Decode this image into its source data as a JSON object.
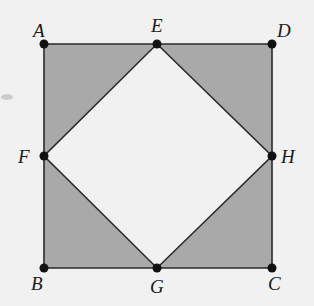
{
  "diagram": {
    "type": "geometry-figure",
    "colors": {
      "background": "#f1f1f1",
      "shaded_fill": "#a9a9a9",
      "line": "#2a2a2a",
      "point": "#111111"
    },
    "points": [
      {
        "name": "A",
        "x": 44,
        "y": 44,
        "label_x": 33,
        "label_y": 37
      },
      {
        "name": "E",
        "x": 157,
        "y": 44,
        "label_x": 151,
        "label_y": 32
      },
      {
        "name": "D",
        "x": 272,
        "y": 44,
        "label_x": 277,
        "label_y": 37
      },
      {
        "name": "F",
        "x": 44,
        "y": 156,
        "label_x": 18,
        "label_y": 163
      },
      {
        "name": "H",
        "x": 272,
        "y": 156,
        "label_x": 281,
        "label_y": 163
      },
      {
        "name": "B",
        "x": 44,
        "y": 268,
        "label_x": 31,
        "label_y": 290
      },
      {
        "name": "G",
        "x": 157,
        "y": 268,
        "label_x": 150,
        "label_y": 293
      },
      {
        "name": "C",
        "x": 272,
        "y": 268,
        "label_x": 268,
        "label_y": 290
      }
    ],
    "outer_square": [
      "A",
      "D",
      "C",
      "B"
    ],
    "inner_square": [
      "E",
      "H",
      "G",
      "F"
    ],
    "shaded_regions": [
      {
        "name": "triangle-AEF",
        "vertices": [
          "A",
          "E",
          "F"
        ]
      },
      {
        "name": "triangle-EDH",
        "vertices": [
          "E",
          "D",
          "H"
        ]
      },
      {
        "name": "triangle-HCG",
        "vertices": [
          "H",
          "C",
          "G"
        ]
      },
      {
        "name": "triangle-GBF",
        "vertices": [
          "G",
          "B",
          "F"
        ]
      }
    ],
    "labels": {
      "A": "A",
      "B": "B",
      "C": "C",
      "D": "D",
      "E": "E",
      "F": "F",
      "G": "G",
      "H": "H"
    }
  }
}
